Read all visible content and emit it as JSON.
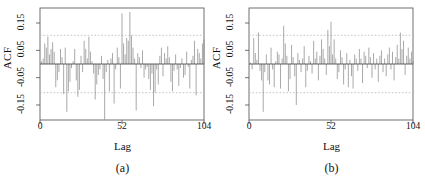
{
  "figure": {
    "title": "",
    "panels": [
      {
        "id": "a",
        "caption": "(a)",
        "ylabel": "ACF",
        "xlabel": "Lag"
      },
      {
        "id": "b",
        "caption": "(b)",
        "ylabel": "ACF",
        "xlabel": "Lag"
      }
    ]
  },
  "style": {
    "stem_color": "#8c8c8c",
    "axis_color": "#4d4d4d",
    "conf_color": "#b9b9b9",
    "text_color": "#111111",
    "background": "#ffffff"
  },
  "chart_data": [
    {
      "type": "bar",
      "title": "(a)",
      "xlabel": "Lag",
      "ylabel": "ACF",
      "xlim": [
        0,
        104
      ],
      "ylim": [
        -0.205,
        0.205
      ],
      "xticks": [
        0,
        52,
        104
      ],
      "xticklabels": [
        "0",
        "52",
        "104"
      ],
      "yticks": [
        0.15,
        0.05,
        -0.05,
        -0.15
      ],
      "yticklabels": [
        "0.15",
        "0.05",
        "-0.05",
        "-0.15"
      ],
      "grid": false,
      "legend": null,
      "zero_line": 0,
      "confidence_bands": [
        0.105,
        -0.105
      ],
      "confidence_style": "dashed",
      "categories": [
        1,
        2,
        3,
        4,
        5,
        6,
        7,
        8,
        9,
        10,
        11,
        12,
        13,
        14,
        15,
        16,
        17,
        18,
        19,
        20,
        21,
        22,
        23,
        24,
        25,
        26,
        27,
        28,
        29,
        30,
        31,
        32,
        33,
        34,
        35,
        36,
        37,
        38,
        39,
        40,
        41,
        42,
        43,
        44,
        45,
        46,
        47,
        48,
        49,
        50,
        51,
        52,
        53,
        54,
        55,
        56,
        57,
        58,
        59,
        60,
        61,
        62,
        63,
        64,
        65,
        66,
        67,
        68,
        69,
        70,
        71,
        72,
        73,
        74,
        75,
        76,
        77,
        78,
        79,
        80,
        81,
        82,
        83,
        84,
        85,
        86,
        87,
        88,
        89,
        90,
        91,
        92,
        93,
        94,
        95,
        96,
        97,
        98,
        99,
        100,
        101,
        102,
        103,
        104
      ],
      "values": [
        0.01,
        0.02,
        0.075,
        0.06,
        0.1,
        0.035,
        0.055,
        0.08,
        0.045,
        -0.085,
        -0.06,
        -0.03,
        0.055,
        0.025,
        -0.11,
        0.06,
        -0.175,
        -0.1,
        -0.065,
        -0.015,
        0.01,
        0.055,
        -0.06,
        -0.12,
        -0.095,
        0.03,
        -0.03,
        0.085,
        0.055,
        0.02,
        0.1,
        0.045,
        0.01,
        -0.035,
        -0.13,
        -0.075,
        -0.04,
        -0.02,
        0.03,
        -0.055,
        -0.205,
        -0.03,
        0.015,
        -0.1,
        0.02,
        0.04,
        -0.145,
        -0.02,
        0.06,
        0.025,
        -0.09,
        0.185,
        0.075,
        0.035,
        0.095,
        0.085,
        0.19,
        0.105,
        0.06,
        0.02,
        -0.17,
        0.04,
        0.025,
        -0.015,
        0.05,
        -0.05,
        -0.02,
        -0.01,
        -0.055,
        -0.095,
        -0.035,
        -0.155,
        -0.105,
        -0.02,
        -0.075,
        0.03,
        0.06,
        -0.045,
        0.04,
        0.02,
        0.065,
        0.025,
        -0.065,
        -0.1,
        -0.025,
        0.035,
        -0.02,
        -0.08,
        -0.015,
        0.02,
        -0.05,
        -0.04,
        0.045,
        -0.01,
        -0.09,
        0.015,
        0.03,
        0.085,
        -0.115,
        0.055,
        0.04,
        0.02,
        0.075,
        0.09
      ]
    },
    {
      "type": "bar",
      "title": "(b)",
      "xlabel": "Lag",
      "ylabel": "ACF",
      "xlim": [
        0,
        104
      ],
      "ylim": [
        -0.205,
        0.205
      ],
      "xticks": [
        0,
        52,
        104
      ],
      "xticklabels": [
        "0",
        "52",
        "104"
      ],
      "yticks": [
        0.15,
        0.05,
        -0.05,
        -0.15
      ],
      "yticklabels": [
        "0.15",
        "0.05",
        "-0.05",
        "-0.15"
      ],
      "grid": false,
      "legend": null,
      "zero_line": 0,
      "confidence_bands": [
        0.105,
        -0.105
      ],
      "confidence_style": "dashed",
      "categories": [
        1,
        2,
        3,
        4,
        5,
        6,
        7,
        8,
        9,
        10,
        11,
        12,
        13,
        14,
        15,
        16,
        17,
        18,
        19,
        20,
        21,
        22,
        23,
        24,
        25,
        26,
        27,
        28,
        29,
        30,
        31,
        32,
        33,
        34,
        35,
        36,
        37,
        38,
        39,
        40,
        41,
        42,
        43,
        44,
        45,
        46,
        47,
        48,
        49,
        50,
        51,
        52,
        53,
        54,
        55,
        56,
        57,
        58,
        59,
        60,
        61,
        62,
        63,
        64,
        65,
        66,
        67,
        68,
        69,
        70,
        71,
        72,
        73,
        74,
        75,
        76,
        77,
        78,
        79,
        80,
        81,
        82,
        83,
        84,
        85,
        86,
        87,
        88,
        89,
        90,
        91,
        92,
        93,
        94,
        95,
        96,
        97,
        98,
        99,
        100,
        101,
        102,
        103,
        104
      ],
      "values": [
        0.005,
        -0.02,
        0.095,
        0.04,
        0.015,
        0.115,
        -0.025,
        -0.06,
        -0.175,
        -0.03,
        0.035,
        -0.06,
        -0.075,
        0.06,
        -0.02,
        -0.085,
        0.01,
        0.045,
        0.035,
        -0.09,
        0.02,
        0.14,
        0.075,
        0.03,
        -0.1,
        -0.055,
        0.07,
        0.025,
        -0.045,
        -0.15,
        0.04,
        0.015,
        -0.03,
        0.02,
        0.065,
        -0.085,
        -0.025,
        0.03,
        0.01,
        -0.035,
        0.085,
        0.02,
        0.045,
        -0.06,
        0.03,
        0.09,
        0.055,
        0.02,
        -0.04,
        0.125,
        0.065,
        0.155,
        0.035,
        0.09,
        0.02,
        -0.055,
        -0.03,
        0.05,
        0.025,
        -0.075,
        -0.02,
        0.04,
        -0.085,
        0.015,
        -0.045,
        -0.09,
        0.035,
        0.02,
        -0.025,
        0.055,
        0.02,
        -0.07,
        0.045,
        0.03,
        -0.015,
        0.06,
        0.025,
        -0.05,
        0.04,
        -0.02,
        0.02,
        -0.065,
        0.03,
        0.05,
        -0.03,
        0.02,
        -0.045,
        0.035,
        0.06,
        -0.02,
        0.045,
        -0.06,
        0.025,
        0.07,
        0.02,
        0.115,
        0.055,
        0.085,
        -0.04,
        0.03,
        0.06,
        0.02,
        0.045,
        0.01
      ]
    }
  ]
}
